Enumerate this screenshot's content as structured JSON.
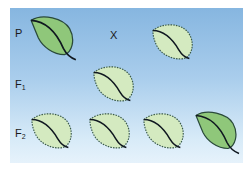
{
  "diagram": {
    "title": "",
    "generations": [
      {
        "label": "P",
        "subscript": ""
      },
      {
        "label": "F",
        "subscript": "1"
      },
      {
        "label": "F",
        "subscript": "2"
      }
    ],
    "cross_symbol": "X",
    "colors": {
      "background_top": "#86b6e0",
      "background_bottom": "#e6f2fb",
      "smooth_leaf_fill": "#8fc77a",
      "serrated_leaf_fill": "#d4eac0",
      "outline": "#2a4a3a",
      "midrib": "#101820"
    },
    "leaves": [
      {
        "row": "P",
        "type": "smooth"
      },
      {
        "row": "P",
        "type": "serrated"
      },
      {
        "row": "F1",
        "type": "serrated"
      },
      {
        "row": "F2",
        "type": "serrated"
      },
      {
        "row": "F2",
        "type": "serrated"
      },
      {
        "row": "F2",
        "type": "serrated"
      },
      {
        "row": "F2",
        "type": "smooth"
      }
    ]
  }
}
